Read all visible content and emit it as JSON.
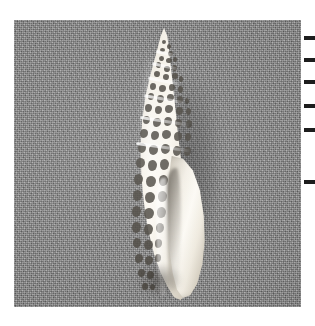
{
  "page": {
    "background_color": "#ffffff",
    "width": 315,
    "height": 326
  },
  "photo": {
    "label": "shell-photograph",
    "type": "natural-image",
    "color_mode": "grayscale",
    "background_color": "#8a8a8a",
    "background_description": "flat uniform mid-gray photographic backdrop with fine film grain",
    "frame": {
      "x": 14,
      "y": 20,
      "width": 287,
      "height": 287
    },
    "border_color": "#6f6f6f"
  },
  "subject": {
    "name": "seashell",
    "common_description": "elongate high-spired sea snail shell, mitre or auger form",
    "orientation": "apex up, aperture facing lower right",
    "bounding_box": {
      "x": 118,
      "y": 28,
      "width": 92,
      "height": 272
    },
    "shell_base_color": "#f3efe6",
    "pattern_color": "#4a463f",
    "pattern_description": "dense reticulated leopard-spot blotches over a cream ground",
    "parts": [
      {
        "name": "apex",
        "description": "pointed tip of the spire at the top"
      },
      {
        "name": "spire",
        "description": "tapering series of whorls separated by raised sutures"
      },
      {
        "name": "body-whorl",
        "description": "widest lower whorl carrying the boldest spotting"
      },
      {
        "name": "aperture",
        "description": "smooth glossy unmarked opening along the right flank"
      },
      {
        "name": "outer-lip",
        "description": "bright rounded edge bounding the aperture"
      },
      {
        "name": "columella",
        "description": "pale inner pillar of the opening"
      },
      {
        "name": "siphonal-canal",
        "description": "narrow channel at the lower end of the shell"
      }
    ]
  },
  "shadow": {
    "name": "cast-shadow",
    "description": "soft shadow falling to the right and below the shell",
    "color": "#5f5f5f"
  },
  "margin_ticks": {
    "name": "registration-ticks",
    "description": "small black tick marks along the right page margin",
    "color": "#1d1d1d",
    "positions_y": [
      36,
      58,
      80,
      104,
      128,
      180
    ]
  }
}
